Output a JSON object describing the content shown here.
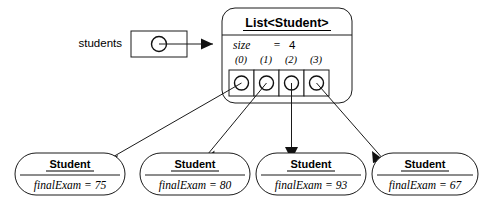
{
  "diagram": {
    "type": "object-reference-diagram",
    "background_color": "#ffffff",
    "line_color": "#1a1a1a",
    "variable": {
      "label": "students",
      "value_icon": "reference-circle-icon"
    },
    "list_object": {
      "class_name": "List<Student>",
      "size_field_label": "size",
      "size_equals": "=",
      "size_value": "4",
      "cells": [
        {
          "index_label": "(0)",
          "value_icon": "reference-circle-icon"
        },
        {
          "index_label": "(1)",
          "value_icon": "reference-circle-icon"
        },
        {
          "index_label": "(2)",
          "value_icon": "reference-circle-icon"
        },
        {
          "index_label": "(3)",
          "value_icon": "reference-circle-icon"
        }
      ]
    },
    "student_objects": [
      {
        "class_name": "Student",
        "field_text": "finalExam = 75"
      },
      {
        "class_name": "Student",
        "field_text": "finalExam = 80"
      },
      {
        "class_name": "Student",
        "field_text": "finalExam = 93"
      },
      {
        "class_name": "Student",
        "field_text": "finalExam = 67"
      }
    ]
  }
}
